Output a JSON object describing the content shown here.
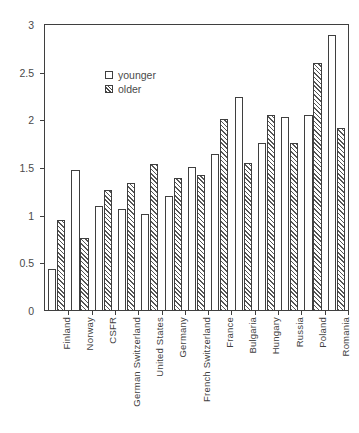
{
  "chart_data": {
    "type": "bar",
    "title": "",
    "xlabel": "",
    "ylabel": "hours",
    "ylim": [
      0,
      3
    ],
    "yticks": [
      "0",
      "0.5",
      "1",
      "1.5",
      "2",
      "2.5",
      "3"
    ],
    "ytick_values": [
      0,
      0.5,
      1,
      1.5,
      2,
      2.5,
      3
    ],
    "grid": false,
    "legend_position": "upper-center",
    "categories": [
      "Finland",
      "Norway",
      "CSFR",
      "German Switzerland",
      "United States",
      "Germany",
      "French Switzerland",
      "France",
      "Bulgaria",
      "Hungary",
      "Russia",
      "Poland",
      "Romania"
    ],
    "series": [
      {
        "name": "younger",
        "values": [
          0.44,
          1.48,
          1.1,
          1.07,
          1.02,
          1.21,
          1.51,
          1.65,
          2.24,
          1.76,
          2.04,
          2.06,
          2.9
        ]
      },
      {
        "name": "older",
        "values": [
          0.95,
          0.77,
          1.27,
          1.34,
          1.54,
          1.4,
          1.43,
          2.01,
          1.55,
          2.06,
          1.76,
          2.6,
          1.92
        ]
      }
    ]
  },
  "legend": {
    "items": [
      {
        "label": "younger",
        "swatch": "open-square-icon"
      },
      {
        "label": "older",
        "swatch": "hatched-square-icon"
      }
    ]
  },
  "colors": {
    "axis": "#3f3f3f",
    "text": "#4a4a4a",
    "younger_fill": "#ffffff",
    "older_hatch": "#555555",
    "background": "#ffffff"
  }
}
